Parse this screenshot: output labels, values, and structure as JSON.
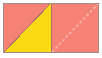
{
  "figure": {
    "name": "two-square-rectangle-diagonals",
    "canvas": {
      "width": 102,
      "height": 58
    },
    "background_color": "#FFFFFF",
    "outline_color": "#A38B86",
    "outline_width": 1,
    "colors": {
      "pink": "#F58274",
      "yellow": "#FAD814",
      "dashed_line": "#F9ADA3",
      "divider": "#A8736A"
    },
    "bounds": {
      "x": 3,
      "y": 3,
      "width": 96,
      "height": 50
    },
    "divider_x": 51,
    "shapes": [
      {
        "id": "left-upper-triangle",
        "label": "pink triangle",
        "fill": "#F58274",
        "points": "3,3 51,3 3,53"
      },
      {
        "id": "left-lower-triangle",
        "label": "yellow triangle",
        "fill": "#FAD814",
        "points": "51,3 51,53 3,53"
      },
      {
        "id": "right-square",
        "label": "pink square",
        "fill": "#F58274",
        "x": 51,
        "y": 3,
        "width": 48,
        "height": 50
      }
    ],
    "lines": [
      {
        "id": "left-diagonal",
        "label": "solid diagonal",
        "style": "solid",
        "color": "#A8736A",
        "width": 1,
        "x1": 51,
        "y1": 3,
        "x2": 3,
        "y2": 53
      },
      {
        "id": "center-divider",
        "label": "vertical divider",
        "style": "solid",
        "color": "#A8736A",
        "width": 1,
        "x1": 51,
        "y1": 3,
        "x2": 51,
        "y2": 53
      },
      {
        "id": "right-diagonal",
        "label": "dashed diagonal",
        "style": "dashed",
        "dash_pattern": "3 2",
        "color": "#F9ADA3",
        "width": 2,
        "x1": 99,
        "y1": 3,
        "x2": 51,
        "y2": 53
      }
    ]
  }
}
